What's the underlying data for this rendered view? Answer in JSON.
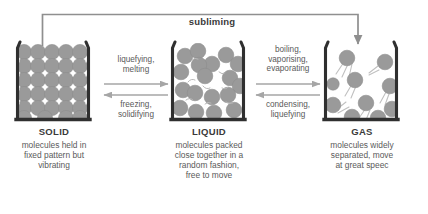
{
  "diagram": {
    "title_text": "subliming",
    "states": [
      {
        "key": "solid",
        "name": "SOLID",
        "description": "molecules held in fixed pattern but vibrating",
        "desc_lines": [
          "molecules held in",
          "fixed pattern but",
          "vibrating"
        ],
        "particle_arrangement": "regular-lattice",
        "particle_count": 30
      },
      {
        "key": "liquid",
        "name": "LIQUID",
        "description": "molecules packed close together in a random fashion, free to move",
        "desc_lines": [
          "molecules packed",
          "close together in a",
          "random fashion,",
          "free to move"
        ],
        "particle_arrangement": "random-packed",
        "particle_count": 18
      },
      {
        "key": "gas",
        "name": "GAS",
        "description": "molecules widely separated, move at great speec",
        "desc_lines": [
          "molecules widely",
          "separated, move",
          "at great speec"
        ],
        "particle_arrangement": "widely-separated",
        "particle_count": 10
      }
    ],
    "transitions": [
      {
        "key": "solid-to-liquid",
        "direction": "forward",
        "lines": [
          "liquefying,",
          "melting"
        ]
      },
      {
        "key": "liquid-to-solid",
        "direction": "reverse",
        "lines": [
          "freezing,",
          "solidifying"
        ]
      },
      {
        "key": "liquid-to-gas",
        "direction": "forward",
        "lines": [
          "boiling,",
          "vaporising,",
          "evaporating"
        ]
      },
      {
        "key": "gas-to-liquid",
        "direction": "reverse",
        "lines": [
          "condensing,",
          "liquefying"
        ]
      }
    ],
    "colors": {
      "background": "#ffffff",
      "particle_fill": "#9a9a9a",
      "particle_stroke": "#8a8a8a",
      "beaker_stroke": "#2f2f2f",
      "arrow_stroke": "#9b9b9b",
      "sublime_arrow_stroke": "#8f8f8f",
      "title_text": "#3a3a3a",
      "body_text": "#5a5a5a"
    }
  }
}
